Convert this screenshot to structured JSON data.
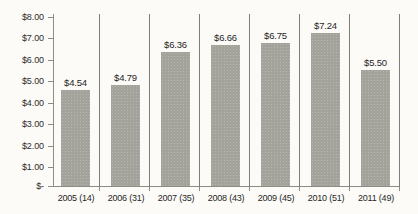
{
  "chart_data": {
    "type": "bar",
    "title": "",
    "subtitle": "",
    "xlabel": "",
    "ylabel": "",
    "categories": [
      "2005 (14)",
      "2006 (31)",
      "2007 (35)",
      "2008 (43)",
      "2009 (45)",
      "2010 (51)",
      "2011 (49)"
    ],
    "values": [
      4.54,
      4.79,
      6.36,
      6.66,
      6.75,
      7.24,
      5.5
    ],
    "data_labels": [
      "$4.54",
      "$4.79",
      "$6.36",
      "$6.66",
      "$6.75",
      "$7.24",
      "$5.50"
    ],
    "ylim": [
      0,
      8
    ],
    "ytick_values": [
      8,
      7,
      6,
      5,
      4,
      3,
      2,
      1,
      0
    ],
    "ytick_labels": [
      "$8.00",
      "$7.00",
      "$6.00",
      "$5.00",
      "$4.00",
      "$3.00",
      "$2.00",
      "$1.00",
      "$-"
    ],
    "grid": false,
    "legend": false,
    "legend_position": "none",
    "series": [
      {
        "name": "",
        "values": [
          4.54,
          4.79,
          6.36,
          6.66,
          6.75,
          7.24,
          5.5
        ]
      }
    ]
  },
  "colors": {
    "bar_fill": "#a3a39c",
    "axis": "#8d8d86",
    "separator": "#7f7f78",
    "text": "#1f1f1f",
    "background": "#fcfbf7"
  }
}
